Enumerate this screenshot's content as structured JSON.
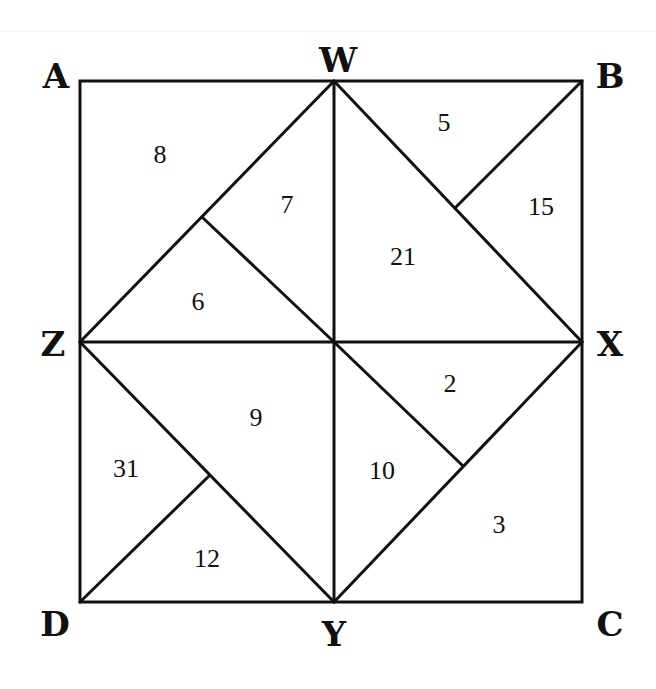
{
  "diagram": {
    "title": "",
    "vertices": [
      {
        "id": "A",
        "label": "A",
        "x": 80,
        "y": 81,
        "lx": 56,
        "ly": 88
      },
      {
        "id": "W",
        "label": "W",
        "x": 334,
        "y": 81,
        "lx": 338,
        "ly": 72
      },
      {
        "id": "B",
        "label": "B",
        "x": 582,
        "y": 81,
        "lx": 610,
        "ly": 88
      },
      {
        "id": "Z",
        "label": "Z",
        "x": 80,
        "y": 342,
        "lx": 53,
        "ly": 356
      },
      {
        "id": "X",
        "label": "X",
        "x": 582,
        "y": 342,
        "lx": 610,
        "ly": 356
      },
      {
        "id": "D",
        "label": "D",
        "x": 80,
        "y": 602,
        "lx": 55,
        "ly": 636
      },
      {
        "id": "Y",
        "label": "Y",
        "x": 334,
        "y": 602,
        "lx": 334,
        "ly": 646
      },
      {
        "id": "C",
        "label": "C",
        "x": 582,
        "y": 602,
        "lx": 610,
        "ly": 636
      }
    ],
    "interior_points": [
      {
        "id": "P1",
        "x": 203,
        "y": 218
      },
      {
        "id": "P2",
        "x": 455,
        "y": 208
      },
      {
        "id": "P3",
        "x": 462,
        "y": 465
      },
      {
        "id": "P4",
        "x": 209,
        "y": 476
      }
    ],
    "segments": [
      [
        "A",
        "B"
      ],
      [
        "B",
        "C"
      ],
      [
        "C",
        "D"
      ],
      [
        "D",
        "A"
      ],
      [
        "W",
        "Y"
      ],
      [
        "Z",
        "X"
      ],
      [
        "Z",
        "W"
      ],
      [
        "W",
        "X"
      ],
      [
        "X",
        "Y"
      ],
      [
        "Y",
        "Z"
      ],
      [
        "P1",
        "Y_to_center"
      ],
      [
        "B",
        "P2"
      ],
      [
        "Z_center",
        "P3"
      ],
      [
        "D",
        "P4"
      ]
    ],
    "regions": [
      {
        "value": "8",
        "x": 160,
        "y": 163
      },
      {
        "value": "7",
        "x": 287,
        "y": 213
      },
      {
        "value": "6",
        "x": 198,
        "y": 310
      },
      {
        "value": "5",
        "x": 444,
        "y": 131
      },
      {
        "value": "15",
        "x": 541,
        "y": 215
      },
      {
        "value": "21",
        "x": 403,
        "y": 265
      },
      {
        "value": "9",
        "x": 256,
        "y": 426
      },
      {
        "value": "2",
        "x": 450,
        "y": 392
      },
      {
        "value": "31",
        "x": 126,
        "y": 477
      },
      {
        "value": "10",
        "x": 382,
        "y": 479
      },
      {
        "value": "12",
        "x": 207,
        "y": 567
      },
      {
        "value": "3",
        "x": 499,
        "y": 533
      }
    ],
    "colors": {
      "line": "#111111",
      "background": "#ffffff"
    }
  }
}
